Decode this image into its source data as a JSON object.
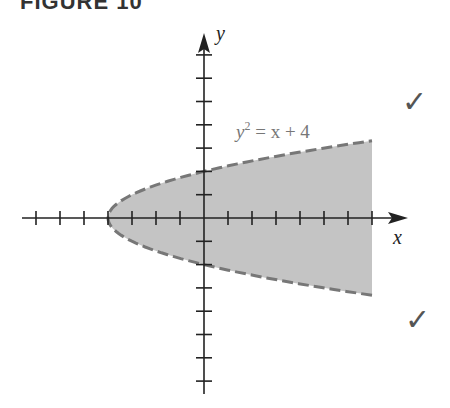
{
  "figure": {
    "title": "FIGURE 10"
  },
  "chart_data": {
    "type": "area",
    "title": "FIGURE 10",
    "xlabel": "x",
    "ylabel": "y",
    "annotation": "y² = x + 4",
    "boundary": {
      "equation": "y^2 = x + 4",
      "style": "dashed",
      "color": "#777777"
    },
    "shaded_region": {
      "description": "y^2 < x + 4, for -4 <= x <= 7",
      "fill": "#c4c4c4"
    },
    "xlim": [
      -7,
      7
    ],
    "ylim": [
      -7,
      7
    ],
    "x_ticks": [
      -7,
      -6,
      -5,
      -4,
      -3,
      -2,
      -1,
      1,
      2,
      3,
      4,
      5,
      6,
      7
    ],
    "y_ticks": [
      -7,
      -6,
      -5,
      -4,
      -3,
      -2,
      -1,
      1,
      2,
      3,
      4,
      5,
      6,
      7
    ],
    "vertex": [
      -4,
      0
    ],
    "grid": false,
    "legend": null
  },
  "labels": {
    "x_axis": "x",
    "y_axis": "y",
    "eq_y": "y",
    "eq_sup": "2",
    "eq_rest": " = x + 4"
  },
  "marks": {
    "check_top": "✓",
    "check_bottom": "✓"
  }
}
